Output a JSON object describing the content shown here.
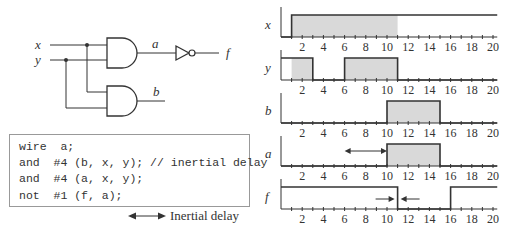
{
  "circuit": {
    "inputs": [
      "x",
      "y"
    ],
    "outputs": [
      "a",
      "b",
      "f"
    ],
    "gates": [
      {
        "type": "and",
        "output": "a",
        "inputs": [
          "x",
          "y"
        ]
      },
      {
        "type": "and",
        "output": "b",
        "inputs": [
          "x",
          "y"
        ]
      },
      {
        "type": "not",
        "output": "f",
        "inputs": [
          "a"
        ]
      }
    ]
  },
  "code": {
    "lines": [
      "wire  a;",
      "and  #4 (b, x, y); // inertial delay",
      "and  #4 (a, x, y);",
      "not  #1 (f, a);"
    ]
  },
  "legend": {
    "label": "Inertial delay",
    "icon": "double-arrow-icon"
  },
  "timing": {
    "axis": {
      "min": 0,
      "max": 20,
      "tick_labels": [
        "2",
        "4",
        "6",
        "8",
        "10",
        "12",
        "14",
        "16",
        "18",
        "20"
      ]
    },
    "signals": [
      {
        "name": "x",
        "transitions": [
          [
            0,
            0
          ],
          [
            1,
            1
          ]
        ],
        "shaded": [
          [
            1,
            11
          ]
        ]
      },
      {
        "name": "y",
        "transitions": [
          [
            0,
            1
          ],
          [
            3,
            0
          ],
          [
            6,
            1
          ],
          [
            11,
            0
          ]
        ],
        "shaded": [
          [
            1,
            3
          ],
          [
            6,
            11
          ]
        ]
      },
      {
        "name": "b",
        "transitions": [
          [
            0,
            0
          ],
          [
            10,
            1
          ],
          [
            15,
            0
          ]
        ],
        "shaded": [
          [
            10,
            15
          ]
        ]
      },
      {
        "name": "a",
        "transitions": [
          [
            0,
            0
          ],
          [
            10,
            1
          ],
          [
            15,
            0
          ]
        ],
        "shaded": [
          [
            10,
            15
          ]
        ],
        "annotation": {
          "type": "double-arrow",
          "from": 6,
          "to": 10
        }
      },
      {
        "name": "f",
        "transitions": [
          [
            0,
            1
          ],
          [
            11,
            0
          ],
          [
            16,
            1
          ]
        ],
        "shaded": [],
        "annotation": {
          "type": "inward-arrows",
          "at": 11
        }
      }
    ]
  }
}
